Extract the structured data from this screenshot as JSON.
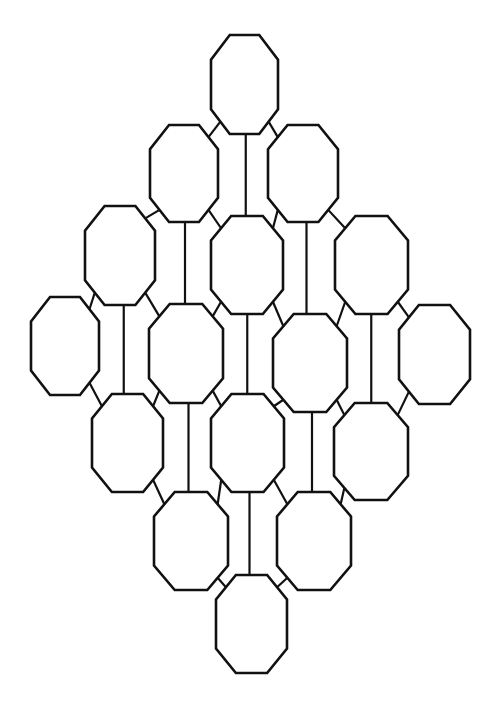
{
  "diagram": {
    "stroke_color": "#111111",
    "fill_color": "#ffffff",
    "background": "#ffffff",
    "rows": [
      {
        "row": 1,
        "nodes": [
          "n1"
        ]
      },
      {
        "row": 2,
        "nodes": [
          "n2",
          "n3"
        ]
      },
      {
        "row": 3,
        "nodes": [
          "n4",
          "n5",
          "n6"
        ]
      },
      {
        "row": 4,
        "nodes": [
          "n7",
          "n8",
          "n9",
          "n10"
        ]
      },
      {
        "row": 5,
        "nodes": [
          "n11",
          "n12",
          "n13"
        ]
      },
      {
        "row": 6,
        "nodes": [
          "n14",
          "n15"
        ]
      },
      {
        "row": 7,
        "nodes": [
          "n16"
        ]
      }
    ],
    "node_count": 16,
    "edges": [
      {
        "from": "n1",
        "to": "n5",
        "kind": "vertical"
      },
      {
        "from": "n1",
        "to": "n2",
        "kind": "diagonal"
      },
      {
        "from": "n1",
        "to": "n3",
        "kind": "diagonal"
      },
      {
        "from": "n2",
        "to": "n8",
        "kind": "vertical"
      },
      {
        "from": "n3",
        "to": "n9",
        "kind": "vertical"
      },
      {
        "from": "n2",
        "to": "n4",
        "kind": "diagonal"
      },
      {
        "from": "n2",
        "to": "n5",
        "kind": "diagonal"
      },
      {
        "from": "n3",
        "to": "n5",
        "kind": "diagonal"
      },
      {
        "from": "n3",
        "to": "n6",
        "kind": "diagonal"
      },
      {
        "from": "n4",
        "to": "n11",
        "kind": "vertical"
      },
      {
        "from": "n5",
        "to": "n12",
        "kind": "vertical"
      },
      {
        "from": "n6",
        "to": "n13",
        "kind": "vertical"
      },
      {
        "from": "n4",
        "to": "n7",
        "kind": "diagonal"
      },
      {
        "from": "n4",
        "to": "n8",
        "kind": "diagonal"
      },
      {
        "from": "n5",
        "to": "n8",
        "kind": "diagonal"
      },
      {
        "from": "n5",
        "to": "n9",
        "kind": "diagonal"
      },
      {
        "from": "n6",
        "to": "n9",
        "kind": "diagonal"
      },
      {
        "from": "n6",
        "to": "n10",
        "kind": "diagonal"
      },
      {
        "from": "n8",
        "to": "n14",
        "kind": "vertical"
      },
      {
        "from": "n9",
        "to": "n15",
        "kind": "vertical"
      },
      {
        "from": "n7",
        "to": "n11",
        "kind": "diagonal"
      },
      {
        "from": "n8",
        "to": "n11",
        "kind": "diagonal"
      },
      {
        "from": "n8",
        "to": "n12",
        "kind": "diagonal"
      },
      {
        "from": "n9",
        "to": "n12",
        "kind": "diagonal"
      },
      {
        "from": "n9",
        "to": "n13",
        "kind": "diagonal"
      },
      {
        "from": "n10",
        "to": "n13",
        "kind": "diagonal"
      },
      {
        "from": "n12",
        "to": "n16",
        "kind": "vertical"
      },
      {
        "from": "n11",
        "to": "n14",
        "kind": "diagonal"
      },
      {
        "from": "n12",
        "to": "n14",
        "kind": "diagonal"
      },
      {
        "from": "n12",
        "to": "n15",
        "kind": "diagonal"
      },
      {
        "from": "n13",
        "to": "n15",
        "kind": "diagonal"
      },
      {
        "from": "n14",
        "to": "n16",
        "kind": "diagonal"
      },
      {
        "from": "n15",
        "to": "n16",
        "kind": "diagonal"
      }
    ]
  }
}
